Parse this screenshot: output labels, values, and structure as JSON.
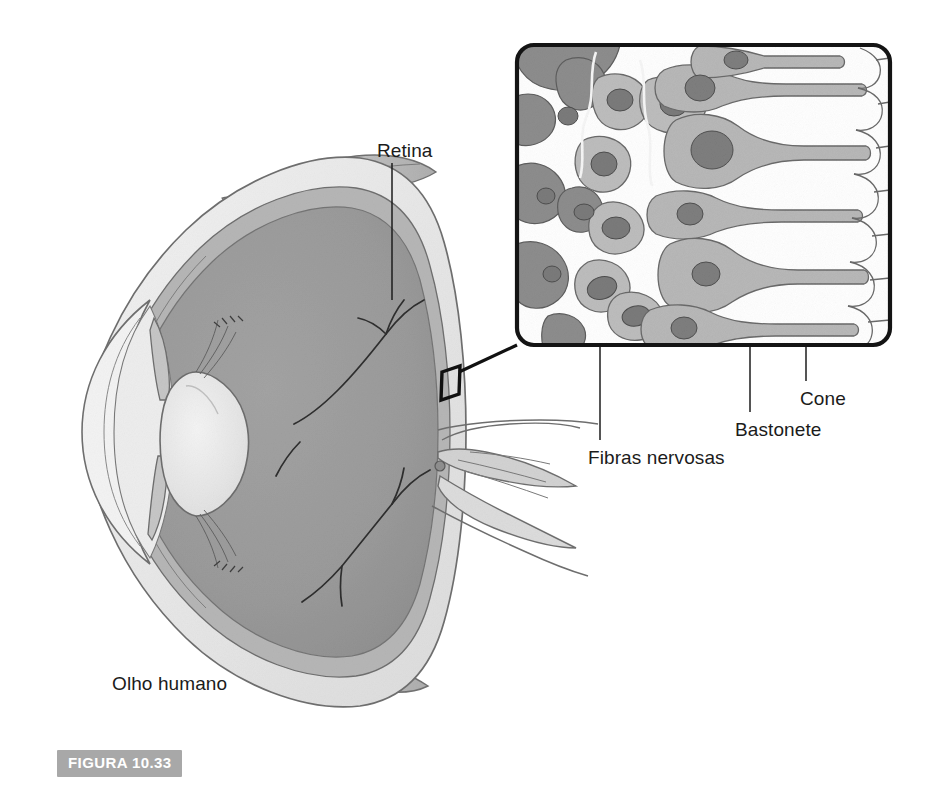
{
  "figure": {
    "badge_label": "FIGURA 10.33",
    "badge_color": "#a8a8a8",
    "badge_text_color": "#ffffff"
  },
  "diagram": {
    "title_label": "Olho humano",
    "type": "anatomical-illustration",
    "language": "pt-BR"
  },
  "labels": [
    {
      "id": "retina",
      "text": "Retina",
      "x": 377,
      "y": 140
    },
    {
      "id": "olho-humano",
      "text": "Olho humano",
      "x": 112,
      "y": 673
    },
    {
      "id": "cone",
      "text": "Cone",
      "x": 800,
      "y": 388
    },
    {
      "id": "bastonete",
      "text": "Bastonete",
      "x": 735,
      "y": 419
    },
    {
      "id": "fibras-nervosas",
      "text": "Fibras nervosas",
      "x": 588,
      "y": 447
    }
  ],
  "colors": {
    "ink": "#1b1b1b",
    "outline": "#6b6b6b",
    "vitreous": "#9a9a9a",
    "choroid": "#b0b0b0",
    "sclera": "#e6e6e6",
    "lens": "#ededed",
    "inset_fiber": "#8a8a8a",
    "inset_cell": "#b4b4b4",
    "inset_nucleus": "#7c7c7c",
    "inset_background": "#ffffff",
    "badge": "#a8a8a8"
  },
  "inset": {
    "name": "retina-detail-inset",
    "border_color": "#151515",
    "x": 517,
    "y": 45,
    "width": 373,
    "height": 300,
    "contents": [
      "nerve fiber layer",
      "ganglion cells",
      "bipolar cells",
      "rod photoreceptors",
      "cone photoreceptors",
      "pigment epithelium"
    ]
  },
  "callout": {
    "name": "retina-callout-box",
    "box_x": 441,
    "box_y": 366,
    "box_w": 19,
    "box_h": 34,
    "line_to_x": 517,
    "line_to_y": 345
  }
}
